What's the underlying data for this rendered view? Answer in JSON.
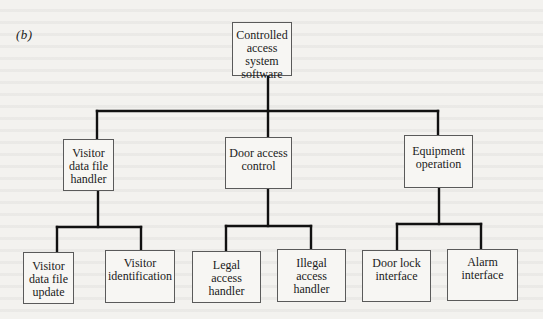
{
  "figure": {
    "label": "(b)"
  },
  "tree": {
    "root": {
      "label": "Controlled\naccess system\nsoftware"
    },
    "level1": [
      {
        "label": "Visitor\ndata file\nhandler"
      },
      {
        "label": "Door access\ncontrol"
      },
      {
        "label": "Equipment\noperation"
      }
    ],
    "level2": [
      {
        "parent": 0,
        "label": "Visitor\ndata file\nupdate"
      },
      {
        "parent": 0,
        "label": "Visitor\nidentification"
      },
      {
        "parent": 1,
        "label": "Legal\naccess\nhandler"
      },
      {
        "parent": 1,
        "label": "Illegal\naccess\nhandler"
      },
      {
        "parent": 2,
        "label": "Door lock\ninterface"
      },
      {
        "parent": 2,
        "label": "Alarm\ninterface"
      }
    ]
  },
  "colors": {
    "background": "#f3f2ef",
    "line": "#111111",
    "box_border": "#5a5a5a"
  }
}
